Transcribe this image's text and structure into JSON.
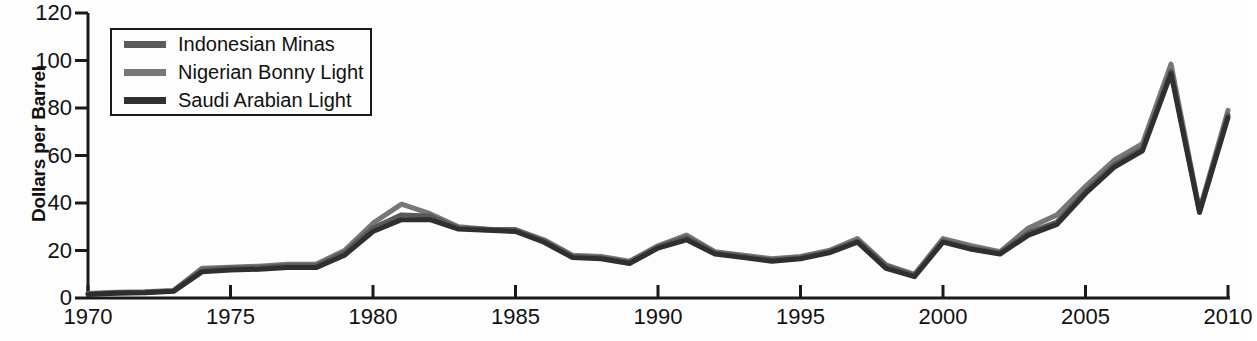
{
  "chart_data": {
    "type": "line",
    "title": "",
    "xlabel": "",
    "ylabel": "Dollars per Barrel",
    "xlim": [
      1970,
      2010
    ],
    "ylim": [
      0,
      120
    ],
    "grid": false,
    "legend_position": "upper-left",
    "x": [
      1970,
      1971,
      1972,
      1973,
      1974,
      1975,
      1976,
      1977,
      1978,
      1979,
      1980,
      1981,
      1982,
      1983,
      1984,
      1985,
      1986,
      1987,
      1988,
      1989,
      1990,
      1991,
      1992,
      1993,
      1994,
      1995,
      1996,
      1997,
      1998,
      1999,
      2000,
      2001,
      2002,
      2003,
      2004,
      2005,
      2006,
      2007,
      2008,
      2009,
      2010
    ],
    "xticks": [
      1970,
      1975,
      1980,
      1985,
      1990,
      1995,
      2000,
      2005,
      2010
    ],
    "xticklabels": [
      "1970",
      "1975",
      "1980",
      "1985",
      "1990",
      "1995",
      "2000",
      "2005",
      "2010"
    ],
    "yticks": [
      0,
      20,
      40,
      60,
      80,
      100,
      120
    ],
    "yticklabels": [
      "0",
      "20",
      "40",
      "60",
      "80",
      "100",
      "120"
    ],
    "series": [
      {
        "name": "Indonesian Minas",
        "color": "#5a5a5a",
        "values": [
          1.7,
          2.2,
          2.4,
          3.0,
          11.7,
          12.6,
          12.8,
          13.6,
          13.6,
          19.0,
          29.5,
          35.0,
          34.5,
          29.5,
          29.0,
          28.6,
          24.0,
          17.5,
          17.0,
          15.0,
          21.5,
          25.5,
          19.0,
          17.5,
          16.0,
          17.0,
          19.5,
          24.0,
          13.5,
          9.5,
          24.0,
          21.0,
          19.0,
          27.5,
          32.0,
          45.0,
          56.0,
          63.0,
          95.5,
          36.5,
          77.0
        ]
      },
      {
        "name": "Nigerian Bonny Light",
        "color": "#777777",
        "values": [
          1.9,
          2.4,
          2.6,
          3.2,
          12.5,
          13.0,
          13.4,
          14.2,
          14.2,
          20.0,
          31.5,
          39.5,
          35.5,
          30.0,
          29.0,
          28.8,
          24.5,
          18.0,
          17.5,
          15.5,
          22.0,
          26.5,
          19.5,
          18.0,
          16.5,
          17.5,
          20.0,
          25.0,
          14.0,
          10.0,
          25.0,
          22.0,
          19.5,
          29.5,
          35.0,
          47.0,
          58.0,
          65.0,
          98.5,
          37.0,
          79.0
        ]
      },
      {
        "name": "Saudi Arabian Light",
        "color": "#2f2f2f",
        "values": [
          1.5,
          2.0,
          2.2,
          2.8,
          11.0,
          11.8,
          12.1,
          12.8,
          12.8,
          18.0,
          28.0,
          33.0,
          33.0,
          29.0,
          28.5,
          28.0,
          23.5,
          17.0,
          16.5,
          14.5,
          21.0,
          24.5,
          18.5,
          17.0,
          15.5,
          16.5,
          19.0,
          23.5,
          12.5,
          9.0,
          23.5,
          20.5,
          18.5,
          26.5,
          31.0,
          44.0,
          55.0,
          62.0,
          94.5,
          36.0,
          76.0
        ]
      }
    ]
  },
  "axis": {
    "ylabel": "Dollars per Barrel",
    "yticklabels": [
      "120",
      "100",
      "80",
      "60",
      "40",
      "20",
      "0"
    ],
    "xticklabels": [
      "1970",
      "1975",
      "1980",
      "1985",
      "1990",
      "1995",
      "2000",
      "2005",
      "2010"
    ]
  },
  "legend": {
    "items": [
      {
        "label": "Indonesian Minas",
        "color": "#5a5a5a"
      },
      {
        "label": "Nigerian Bonny Light",
        "color": "#777777"
      },
      {
        "label": "Saudi Arabian Light",
        "color": "#2f2f2f"
      }
    ]
  }
}
